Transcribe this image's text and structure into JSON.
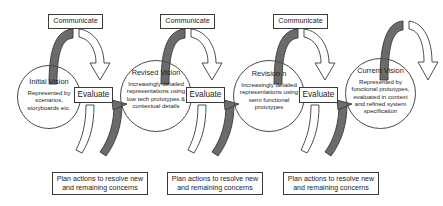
{
  "diagram": {
    "colors": {
      "stroke": "#3a3a3a",
      "band_fill": "#6b6b6b",
      "background": "#ffffff",
      "text": "#1d1d1d"
    },
    "cycles": [
      {
        "communicate_label": "Communicate",
        "evaluate_label": "Evaluate",
        "plan_label": "Plan actions to resolve new and remaining concerns",
        "vision_title": "Initial Vision",
        "vision_body": "Represented by scenarios, storyboards etc."
      },
      {
        "communicate_label": "Communicate",
        "evaluate_label": "Evaluate",
        "plan_label": "Plan actions to resolve new and remaining concerns",
        "vision_title": "Revised Vision",
        "vision_body": "Increasingly detailed representations using low tech prototypes & contextual details"
      },
      {
        "communicate_label": "Communicate",
        "evaluate_label": "Evaluate",
        "plan_label": "Plan actions to resolve new and remaining concerns",
        "vision_title": "Revision n",
        "vision_body": "Increasingly detailed representations using semi functional prototypes"
      },
      {
        "vision_title": "Current Vision",
        "vision_body": "Represented by functional prototypes, evaluated in context and refined system specification"
      }
    ]
  }
}
